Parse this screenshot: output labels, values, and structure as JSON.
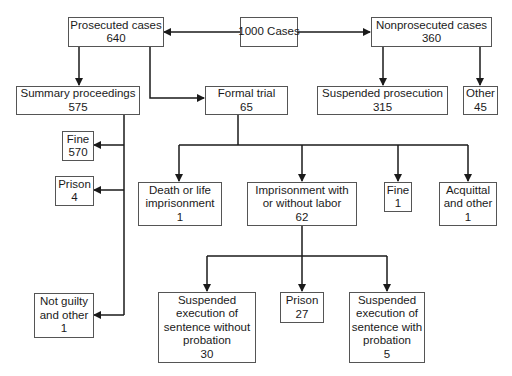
{
  "diagram": {
    "type": "flowchart",
    "colors": {
      "line": "#1a1a1a",
      "border": "#555555",
      "background": "#ffffff"
    },
    "nodes": {
      "total": {
        "lines": [
          "1000 Cases"
        ]
      },
      "prosecuted": {
        "lines": [
          "Prosecuted cases",
          "640"
        ]
      },
      "nonprosecuted": {
        "lines": [
          "Nonprosecuted cases",
          "360"
        ]
      },
      "summary": {
        "lines": [
          "Summary proceedings",
          "575"
        ]
      },
      "formal": {
        "lines": [
          "Formal trial",
          "65"
        ]
      },
      "suspended_pros": {
        "lines": [
          "Suspended prosecution",
          "315"
        ]
      },
      "other": {
        "lines": [
          "Other",
          "45"
        ]
      },
      "sum_fine": {
        "lines": [
          "Fine",
          "570"
        ]
      },
      "sum_prison": {
        "lines": [
          "Prison",
          "4"
        ]
      },
      "sum_notguilty": {
        "lines": [
          "Not guilty",
          "and other",
          "1"
        ]
      },
      "death": {
        "lines": [
          "Death or life",
          "imprisonment",
          "1"
        ]
      },
      "imprisonment": {
        "lines": [
          "Imprisonment with",
          "or without labor",
          "62"
        ]
      },
      "ft_fine": {
        "lines": [
          "Fine",
          "1"
        ]
      },
      "acquittal": {
        "lines": [
          "Acquittal",
          "and other",
          "1"
        ]
      },
      "susp_without": {
        "lines": [
          "Suspended",
          "execution of",
          "sentence without",
          "probation",
          "30"
        ]
      },
      "prison27": {
        "lines": [
          "Prison",
          "27"
        ]
      },
      "susp_with": {
        "lines": [
          "Suspended",
          "execution of",
          "sentence with",
          "probation",
          "5"
        ]
      }
    },
    "edges": [
      [
        "total",
        "prosecuted"
      ],
      [
        "total",
        "nonprosecuted"
      ],
      [
        "prosecuted",
        "summary"
      ],
      [
        "prosecuted",
        "formal"
      ],
      [
        "nonprosecuted",
        "suspended_pros"
      ],
      [
        "nonprosecuted",
        "other"
      ],
      [
        "summary",
        "sum_fine"
      ],
      [
        "summary",
        "sum_prison"
      ],
      [
        "summary",
        "sum_notguilty"
      ],
      [
        "formal",
        "death"
      ],
      [
        "formal",
        "imprisonment"
      ],
      [
        "formal",
        "ft_fine"
      ],
      [
        "formal",
        "acquittal"
      ],
      [
        "imprisonment",
        "susp_without"
      ],
      [
        "imprisonment",
        "prison27"
      ],
      [
        "imprisonment",
        "susp_with"
      ]
    ]
  }
}
